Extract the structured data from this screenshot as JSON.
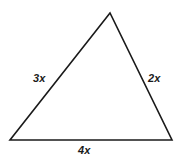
{
  "figure": {
    "background_color": "#ffffff",
    "stroke_color": "#1a1a1a",
    "stroke_width": 1.6,
    "width": 181,
    "height": 164
  },
  "shape": {
    "type": "triangle",
    "vertices": {
      "apex": {
        "x": 110,
        "y": 13
      },
      "bottom_left": {
        "x": 10,
        "y": 140
      },
      "bottom_right": {
        "x": 172,
        "y": 140
      }
    },
    "points": "110,13 10,140 172,140"
  },
  "labels": {
    "left_side": "3x",
    "right_side": "2x",
    "bottom_side": "4x"
  },
  "chart_data": {
    "type": "diagram",
    "title": "",
    "shape": "triangle",
    "sides": [
      {
        "name": "left",
        "label": "3x",
        "coefficient": 3,
        "variable": "x"
      },
      {
        "name": "right",
        "label": "2x",
        "coefficient": 2,
        "variable": "x"
      },
      {
        "name": "bottom",
        "label": "4x",
        "coefficient": 4,
        "variable": "x"
      }
    ]
  }
}
